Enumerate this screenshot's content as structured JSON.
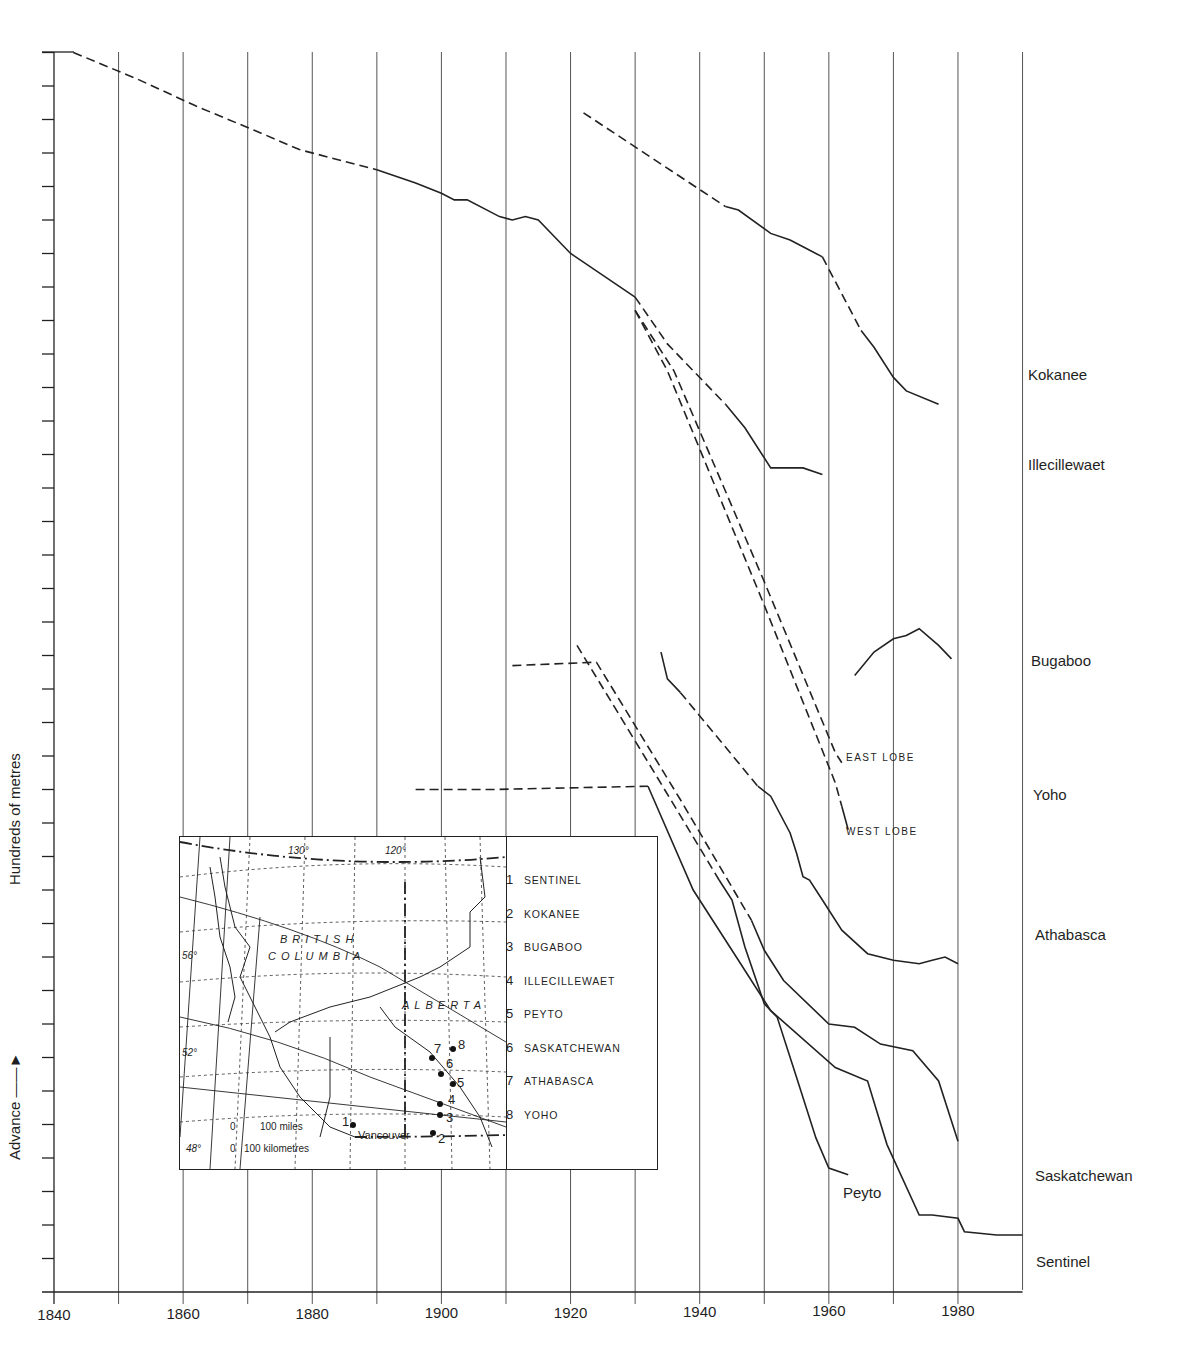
{
  "chart_data": {
    "type": "line",
    "title": "",
    "xlabel": "",
    "ylabel": "Hundreds of metres",
    "y_annotation": "Advance →",
    "xlim": [
      1840,
      1990
    ],
    "x_ticks": [
      "1840",
      "1860",
      "1880",
      "1900",
      "1920",
      "1940",
      "1960",
      "1980"
    ],
    "x_gridlines_every": 10,
    "y_ticks_count": 37,
    "y_unit_per_tick": 1,
    "grid": "vertical only",
    "note": "Cumulative glacier front position curves (vertically offset); dashed = estimated, solid = measured",
    "series": [
      {
        "name": "Kokanee",
        "label_y": "Kokanee",
        "segments": [
          {
            "style": "dashed",
            "points": [
              [
                1922,
                35.2
              ],
              [
                1944,
                32.4
              ]
            ]
          },
          {
            "style": "solid",
            "points": [
              [
                1944,
                32.4
              ],
              [
                1946,
                32.3
              ],
              [
                1951,
                31.6
              ],
              [
                1954,
                31.4
              ],
              [
                1956,
                31.2
              ],
              [
                1959,
                30.9
              ]
            ]
          },
          {
            "style": "dashed",
            "points": [
              [
                1959,
                30.9
              ],
              [
                1965,
                28.7
              ]
            ]
          },
          {
            "style": "solid",
            "points": [
              [
                1965,
                28.7
              ],
              [
                1967,
                28.2
              ],
              [
                1970,
                27.3
              ],
              [
                1972,
                26.9
              ],
              [
                1977,
                26.5
              ]
            ]
          }
        ]
      },
      {
        "name": "Illecillewaet",
        "label_y": "Illecillewaet",
        "segments": [
          {
            "style": "dashed",
            "points": [
              [
                1843,
                37.0
              ],
              [
                1853,
                36.2
              ],
              [
                1862,
                35.4
              ],
              [
                1872,
                34.6
              ],
              [
                1878,
                34.1
              ],
              [
                1890,
                33.5
              ]
            ]
          },
          {
            "style": "solid",
            "points": [
              [
                1890,
                33.5
              ],
              [
                1896,
                33.1
              ],
              [
                1900,
                32.8
              ],
              [
                1902,
                32.6
              ],
              [
                1904,
                32.6
              ],
              [
                1909,
                32.1
              ],
              [
                1911,
                32.0
              ],
              [
                1913,
                32.1
              ],
              [
                1915,
                32.0
              ],
              [
                1920,
                31.0
              ],
              [
                1930,
                29.7
              ]
            ]
          },
          {
            "style": "dashed",
            "points": [
              [
                1930,
                29.7
              ],
              [
                1935,
                28.3
              ],
              [
                1944,
                26.5
              ]
            ]
          },
          {
            "style": "solid",
            "points": [
              [
                1944,
                26.5
              ],
              [
                1947,
                25.8
              ],
              [
                1951,
                24.6
              ],
              [
                1956,
                24.6
              ],
              [
                1959,
                24.4
              ]
            ]
          }
        ]
      },
      {
        "name": "Bugaboo",
        "label_y": "Bugaboo",
        "segments": [
          {
            "style": "solid",
            "points": [
              [
                1964,
                18.4
              ],
              [
                1967,
                19.1
              ],
              [
                1970,
                19.5
              ],
              [
                1972,
                19.6
              ],
              [
                1974,
                19.8
              ],
              [
                1977,
                19.3
              ],
              [
                1979,
                18.9
              ]
            ]
          }
        ]
      },
      {
        "name": "Yoho (East Lobe)",
        "label_y": "Yoho",
        "segments": [
          {
            "style": "dashed",
            "points": [
              [
                1930,
                29.3
              ],
              [
                1936,
                27.5
              ],
              [
                1950,
                21.2
              ],
              [
                1961,
                16.1
              ],
              [
                1962,
                15.8
              ]
            ]
          }
        ]
      },
      {
        "name": "Yoho (West Lobe)",
        "segments": [
          {
            "style": "dashed",
            "points": [
              [
                1930,
                29.3
              ],
              [
                1935,
                27.5
              ],
              [
                1950,
                20.5
              ],
              [
                1961,
                15.2
              ],
              [
                1962,
                14.5
              ]
            ]
          },
          {
            "style": "solid",
            "points": [
              [
                1962,
                14.5
              ],
              [
                1963,
                13.8
              ]
            ]
          }
        ]
      },
      {
        "name": "Athabasca",
        "label_y": "Athabasca",
        "segments": [
          {
            "style": "solid",
            "points": [
              [
                1934,
                19.1
              ],
              [
                1935,
                18.3
              ],
              [
                1937,
                17.9
              ]
            ]
          },
          {
            "style": "dashed",
            "points": [
              [
                1937,
                17.9
              ],
              [
                1949,
                15.1
              ]
            ]
          },
          {
            "style": "solid",
            "points": [
              [
                1949,
                15.1
              ],
              [
                1951,
                14.8
              ],
              [
                1954,
                13.7
              ],
              [
                1955,
                13.1
              ],
              [
                1956,
                12.4
              ],
              [
                1957,
                12.3
              ],
              [
                1959,
                11.7
              ],
              [
                1962,
                10.8
              ],
              [
                1966,
                10.1
              ],
              [
                1970,
                9.9
              ],
              [
                1974,
                9.8
              ],
              [
                1976,
                9.9
              ],
              [
                1978,
                10.0
              ],
              [
                1980,
                9.8
              ]
            ]
          }
        ]
      },
      {
        "name": "Saskatchewan",
        "label_y": "Saskatchewan",
        "segments": [
          {
            "style": "dashed",
            "points": [
              [
                1911,
                18.7
              ],
              [
                1924,
                18.8
              ],
              [
                1937,
                14.7
              ],
              [
                1948,
                11.1
              ]
            ]
          },
          {
            "style": "solid",
            "points": [
              [
                1948,
                11.1
              ],
              [
                1950,
                10.2
              ],
              [
                1953,
                9.3
              ],
              [
                1960,
                8.0
              ],
              [
                1964,
                7.9
              ],
              [
                1968,
                7.4
              ],
              [
                1973,
                7.2
              ],
              [
                1977,
                6.3
              ],
              [
                1980,
                4.5
              ]
            ]
          }
        ]
      },
      {
        "name": "Peyto",
        "label_y": "Peyto",
        "segments": [
          {
            "style": "solid",
            "points": [
              [
                1921,
                19.3
              ]
            ]
          },
          {
            "style": "dashed",
            "points": [
              [
                1921,
                19.3
              ],
              [
                1933,
                15.5
              ],
              [
                1943,
                12.3
              ]
            ]
          },
          {
            "style": "solid",
            "points": [
              [
                1943,
                12.3
              ],
              [
                1945,
                11.7
              ],
              [
                1947,
                10.3
              ],
              [
                1950,
                8.6
              ],
              [
                1952,
                8.2
              ],
              [
                1955,
                6.4
              ],
              [
                1958,
                4.6
              ],
              [
                1960,
                3.7
              ],
              [
                1963,
                3.5
              ]
            ]
          }
        ]
      },
      {
        "name": "Sentinel",
        "label_y": "Sentinel",
        "segments": [
          {
            "style": "dashed",
            "points": [
              [
                1896,
                15.0
              ],
              [
                1908,
                15.0
              ],
              [
                1932,
                15.1
              ]
            ]
          },
          {
            "style": "solid",
            "points": [
              [
                1932,
                15.1
              ],
              [
                1939,
                12.0
              ],
              [
                1946,
                9.9
              ],
              [
                1951,
                8.4
              ],
              [
                1961,
                6.7
              ],
              [
                1966,
                6.3
              ],
              [
                1969,
                4.4
              ],
              [
                1974,
                2.3
              ],
              [
                1976,
                2.3
              ],
              [
                1980,
                2.2
              ],
              [
                1981,
                1.8
              ],
              [
                1986,
                1.7
              ],
              [
                1990,
                1.7
              ]
            ]
          }
        ]
      }
    ]
  },
  "axis": {
    "x_ticks": [
      {
        "label": "1840",
        "year": 1840
      },
      {
        "label": "1860",
        "year": 1860
      },
      {
        "label": "1880",
        "year": 1880
      },
      {
        "label": "1900",
        "year": 1900
      },
      {
        "label": "1920",
        "year": 1920
      },
      {
        "label": "1940",
        "year": 1940
      },
      {
        "label": "1960",
        "year": 1960
      },
      {
        "label": "1980",
        "year": 1980
      }
    ],
    "y_label": "Hundreds of metres",
    "advance_label": "Advance"
  },
  "glacier_labels": {
    "kokanee": "Kokanee",
    "illecillewaet": "Illecillewaet",
    "bugaboo": "Bugaboo",
    "yoho": "Yoho",
    "athabasca": "Athabasca",
    "saskatchewan": "Saskatchewan",
    "sentinel": "Sentinel",
    "peyto": "Peyto",
    "east_lobe": "EAST LOBE",
    "west_lobe": "WEST LOBE"
  },
  "inset_map": {
    "regions": {
      "bc_line1": "BRITISH",
      "bc_line2": "COLUMBIA",
      "alberta": "ALBERTA"
    },
    "longitudes": [
      "130°",
      "120°"
    ],
    "latitudes": [
      "56°",
      "52°",
      "48°"
    ],
    "scale_miles": "100 miles",
    "scale_km": "100 kilometres",
    "scale_zero": "0",
    "city": "Vancouver",
    "legend": [
      {
        "num": "1",
        "name": "SENTINEL"
      },
      {
        "num": "2",
        "name": "KOKANEE"
      },
      {
        "num": "3",
        "name": "BUGABOO"
      },
      {
        "num": "4",
        "name": "ILLECILLEWAET"
      },
      {
        "num": "5",
        "name": "PEYTO"
      },
      {
        "num": "6",
        "name": "SASKATCHEWAN"
      },
      {
        "num": "7",
        "name": "ATHABASCA"
      },
      {
        "num": "8",
        "name": "YOHO"
      }
    ]
  }
}
